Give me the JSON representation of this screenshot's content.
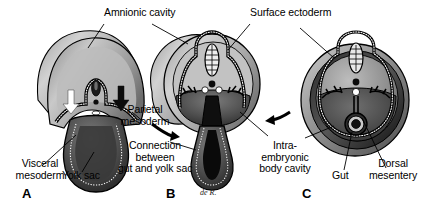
{
  "figure": {
    "background_color": "#ffffff",
    "ink_color": "#000000"
  },
  "labels": {
    "amnionic_cavity": "Amnionic cavity",
    "surface_ectoderm": "Surface ectoderm",
    "parietal_mesoderm": "Parietal\nmesoderm",
    "visceral_mesoderm": "Visceral\nmesoderm",
    "yolk_sac": "Yolk sac",
    "connection_gut_yolk": "Connection\nbetween\ngut and yolk sac",
    "intraembryonic_body_cavity": "Intra-\nembryonic\nbody cavity",
    "gut": "Gut",
    "dorsal_mesentery": "Dorsal\nmesentery"
  },
  "panels": [
    {
      "id": "A",
      "letter": "A",
      "caption": "Early fold: broad amnionic dome over flat embryo with wide yolk sac"
    },
    {
      "id": "B",
      "letter": "B",
      "caption": "Folding: amnion encircles embryo, yolk sac narrows to a stalk"
    },
    {
      "id": "C",
      "letter": "C",
      "caption": "Closed: body wall fused, gut suspended by dorsal mesentery"
    }
  ],
  "annotations": {
    "artist_signature": "de R.",
    "arrow_white_left": "white-fold-arrow-left",
    "arrow_white_right": "white-fold-arrow-right",
    "arrow_black_a_to_b": "progression-arrow-a-to-b",
    "arrow_black_b_to_c": "progression-arrow-b-to-c"
  },
  "colors": {
    "outline": "#000000",
    "amnion_light": "#d8d8d8",
    "amnion_mid": "#a9a9a9",
    "amnion_dark": "#6b6b6b",
    "cavity_dark": "#3b3b3b",
    "cavity_black": "#111111",
    "ectoderm_dots": "#ffffff",
    "highlight": "#f0f0f0"
  }
}
